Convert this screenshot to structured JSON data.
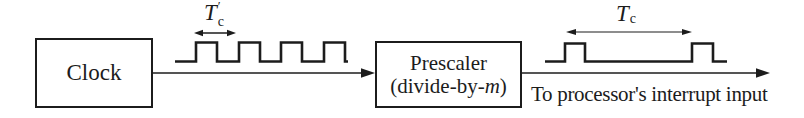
{
  "figure": {
    "background": "#ffffff",
    "line_color": "#1c1c1c",
    "clock_box": {
      "label": "Clock"
    },
    "prescaler_box": {
      "line1": "Prescaler",
      "line2_prefix": "(divide-by-",
      "line2_italic": "m",
      "line2_suffix": ")"
    },
    "clock_period_label": {
      "base": "T",
      "prime": "′",
      "subscript": "c"
    },
    "output_period_label": {
      "base": "T",
      "subscript": "c"
    },
    "output_caption": "To processor's interrupt input"
  }
}
